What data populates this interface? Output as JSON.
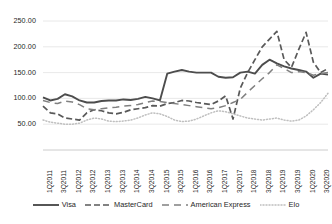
{
  "chart_data": {
    "type": "line",
    "title": "",
    "xlabel": "",
    "ylabel": "",
    "ylim": [
      0,
      250
    ],
    "ytick_labels": [
      "250.00",
      "200.00",
      "150.00",
      "100.00",
      "50.00"
    ],
    "ytick_values": [
      250,
      200,
      150,
      100,
      50
    ],
    "grid": true,
    "legend_position": "bottom",
    "x_tick_labels": [
      "1Q2011",
      "3Q2011",
      "1Q2012",
      "3Q2012",
      "1Q2013",
      "3Q2013",
      "1Q2014",
      "3Q2014",
      "1Q2015",
      "3Q2015",
      "1Q2016",
      "3Q2016",
      "1Q2017",
      "3Q2017",
      "1Q2018",
      "3Q2018",
      "1Q2019",
      "3Q2019",
      "1Q2020",
      "3Q2020"
    ],
    "x": [
      "1Q2011",
      "2Q2011",
      "3Q2011",
      "4Q2011",
      "1Q2012",
      "2Q2012",
      "3Q2012",
      "4Q2012",
      "1Q2013",
      "2Q2013",
      "3Q2013",
      "4Q2013",
      "1Q2014",
      "2Q2014",
      "3Q2014",
      "4Q2014",
      "1Q2015",
      "2Q2015",
      "3Q2015",
      "4Q2015",
      "1Q2016",
      "2Q2016",
      "3Q2016",
      "4Q2016",
      "1Q2017",
      "2Q2017",
      "3Q2017",
      "4Q2017",
      "1Q2018",
      "2Q2018",
      "3Q2018",
      "4Q2018",
      "1Q2019",
      "2Q2019",
      "3Q2019",
      "4Q2019",
      "1Q2020",
      "2Q2020",
      "3Q2020",
      "4Q2020"
    ],
    "series": [
      {
        "name": "Visa",
        "style": "solid",
        "color": "#4d4d4d",
        "values": [
          102,
          96,
          99,
          108,
          104,
          96,
          92,
          92,
          95,
          96,
          96,
          98,
          97,
          99,
          103,
          100,
          96,
          148,
          152,
          155,
          152,
          150,
          150,
          150,
          142,
          140,
          141,
          150,
          152,
          148,
          165,
          175,
          168,
          162,
          158,
          155,
          152,
          140,
          148,
          146
        ]
      },
      {
        "name": "MasterCard",
        "style": "dashed",
        "color": "#595959",
        "values": [
          85,
          72,
          70,
          62,
          60,
          58,
          72,
          78,
          76,
          72,
          70,
          73,
          78,
          80,
          82,
          86,
          85,
          90,
          92,
          96,
          95,
          92,
          90,
          88,
          95,
          105,
          60,
          120,
          150,
          175,
          200,
          215,
          230,
          175,
          160,
          195,
          228,
          170,
          150,
          158
        ]
      },
      {
        "name": "American Express",
        "style": "longdash",
        "color": "#808080",
        "values": [
          96,
          92,
          90,
          95,
          93,
          88,
          80,
          78,
          80,
          82,
          83,
          85,
          86,
          88,
          92,
          95,
          94,
          92,
          90,
          88,
          86,
          84,
          82,
          80,
          82,
          86,
          92,
          98,
          112,
          125,
          138,
          150,
          165,
          158,
          150,
          152,
          150,
          145,
          148,
          150
        ]
      },
      {
        "name": "Elo",
        "style": "dotted",
        "color": "#bfbfbf",
        "values": [
          58,
          54,
          52,
          50,
          50,
          52,
          58,
          62,
          60,
          56,
          55,
          56,
          58,
          62,
          68,
          72,
          70,
          65,
          58,
          55,
          56,
          60,
          66,
          72,
          76,
          74,
          70,
          66,
          62,
          60,
          58,
          60,
          62,
          58,
          56,
          58,
          66,
          78,
          92,
          110
        ]
      }
    ]
  },
  "legend": {
    "items": [
      {
        "label": "Visa",
        "style": "solid",
        "color": "#4d4d4d"
      },
      {
        "label": "MasterCard",
        "style": "dashed",
        "color": "#595959"
      },
      {
        "label": "American Express",
        "style": "longdash",
        "color": "#808080"
      },
      {
        "label": "Elo",
        "style": "dotted",
        "color": "#bfbfbf"
      }
    ]
  }
}
